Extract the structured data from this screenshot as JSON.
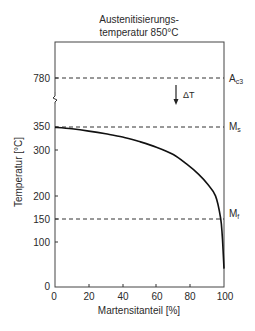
{
  "chart_data": {
    "type": "line",
    "title": "Austenitisierungs-\ntemperatur 850°C",
    "title_lines": [
      "Austenitisierungs-",
      "temperatur 850°C"
    ],
    "xlabel": "Martensitanteil [%]",
    "ylabel": "Temperatur [°C]",
    "xlim": [
      0,
      100
    ],
    "ylim": [
      0,
      780
    ],
    "y_axis_break": true,
    "grid": false,
    "x_ticks": [
      0,
      20,
      40,
      60,
      80,
      100
    ],
    "y_ticks": [
      0,
      100,
      150,
      200,
      300,
      350,
      780
    ],
    "x_tick_labels": [
      "0",
      "20",
      "40",
      "60",
      "80",
      "100"
    ],
    "y_tick_labels": [
      "0",
      "100",
      "150",
      "200",
      "300",
      "350",
      "780"
    ],
    "series": [
      {
        "name": "Martensitbildung",
        "x": [
          0,
          10,
          20,
          30,
          40,
          50,
          60,
          70,
          78,
          85,
          90,
          95,
          98,
          99,
          100
        ],
        "y": [
          347,
          344,
          339,
          333,
          326,
          316,
          304,
          288,
          267,
          245,
          225,
          198,
          150,
          110,
          40
        ]
      }
    ],
    "reference_lines": [
      {
        "name": "A_c3",
        "label": "A",
        "sub": "c3",
        "y": 780,
        "style": "dashed"
      },
      {
        "name": "M_s",
        "label": "M",
        "sub": "s",
        "y": 350,
        "style": "dashed"
      },
      {
        "name": "M_f",
        "label": "M",
        "sub": "f",
        "y": 150,
        "style": "dashed"
      }
    ],
    "annotations": [
      {
        "text": "ΔT",
        "type": "arrow-down",
        "x": 72,
        "y_from": 760,
        "y_to": 400
      }
    ]
  }
}
